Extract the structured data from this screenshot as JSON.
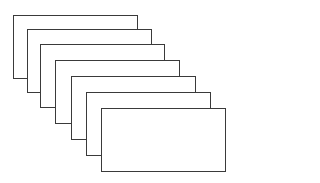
{
  "diagram": {
    "stroke_color": "#3a3a3a",
    "fill_color": "#ffffff",
    "cards": [
      {
        "x": 13,
        "y": 15,
        "w": 125,
        "h": 64
      },
      {
        "x": 27,
        "y": 29,
        "w": 125,
        "h": 64
      },
      {
        "x": 40,
        "y": 44,
        "w": 125,
        "h": 64
      },
      {
        "x": 55,
        "y": 60,
        "w": 125,
        "h": 64
      },
      {
        "x": 71,
        "y": 76,
        "w": 125,
        "h": 64
      },
      {
        "x": 86,
        "y": 92,
        "w": 125,
        "h": 64
      },
      {
        "x": 101,
        "y": 108,
        "w": 125,
        "h": 64
      }
    ]
  }
}
